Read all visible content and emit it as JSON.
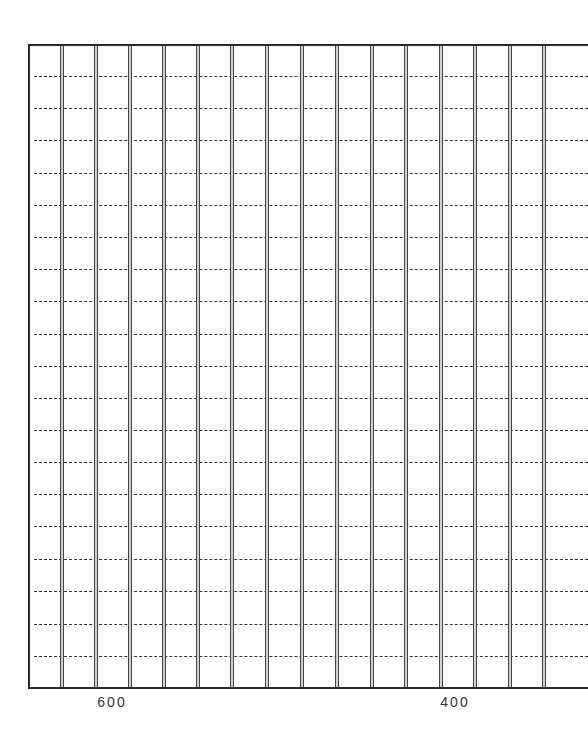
{
  "grid": {
    "frame": {
      "left": 28,
      "top": 44,
      "bottom": 689
    },
    "vertical_lines_x": [
      62,
      96,
      130,
      164,
      198,
      232,
      267,
      302,
      337,
      372,
      406,
      441,
      475,
      510,
      544
    ],
    "dashed_lines_y": [
      76,
      108,
      140,
      173,
      205,
      237,
      269,
      301,
      334,
      366,
      398,
      430,
      462,
      494,
      526,
      559,
      591,
      624,
      656
    ],
    "line_color": "#2a2a2a"
  },
  "axis": {
    "labels": [
      {
        "text": "600",
        "x": 112
      },
      {
        "text": "400",
        "x": 455
      }
    ]
  }
}
